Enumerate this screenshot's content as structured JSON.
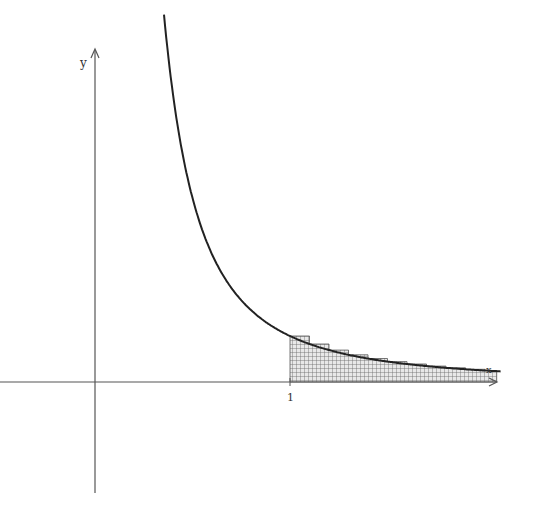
{
  "diagram": {
    "type": "function-graph",
    "axes": {
      "x_label": "x",
      "y_label": "y",
      "tick_labels": [
        {
          "value": 1,
          "label": "1"
        }
      ]
    },
    "curve": {
      "description": "decreasing curve y = 1/x^2 (hyperbola-like), asymptotic to both axes"
    },
    "shaded_region": {
      "from_x": "1",
      "to_x": "infinity",
      "style": "grid hatching with staircase rectangle tops"
    }
  },
  "colors": {
    "axis": "#555555",
    "curve": "#222222",
    "hatch": "#666666"
  }
}
